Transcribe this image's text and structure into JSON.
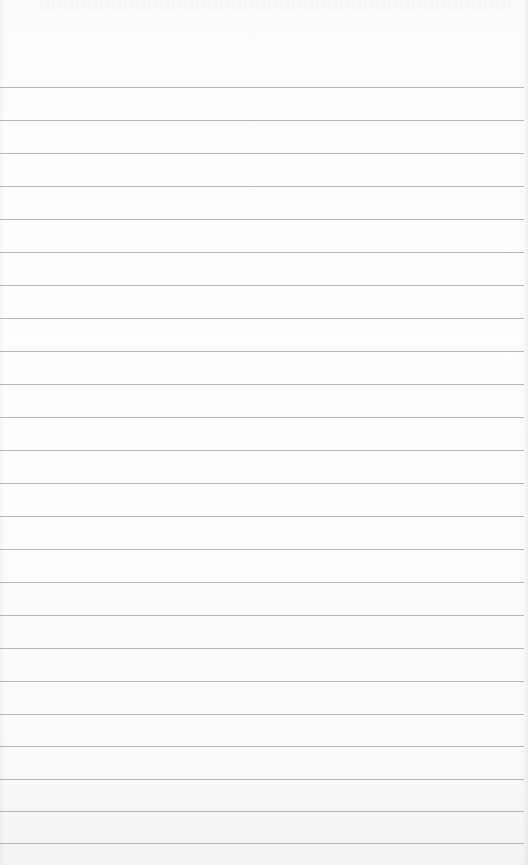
{
  "page": {
    "type": "lined-notepad",
    "background_color": "#fcfcfc",
    "rule_color": "#a9a9a9",
    "rule_count": 24,
    "rule_positions_y": [
      87,
      120,
      153,
      186,
      219,
      252,
      285,
      318,
      351,
      384,
      417,
      450,
      483,
      516,
      549,
      582,
      615,
      648,
      681,
      714,
      746,
      779,
      811,
      843
    ]
  }
}
